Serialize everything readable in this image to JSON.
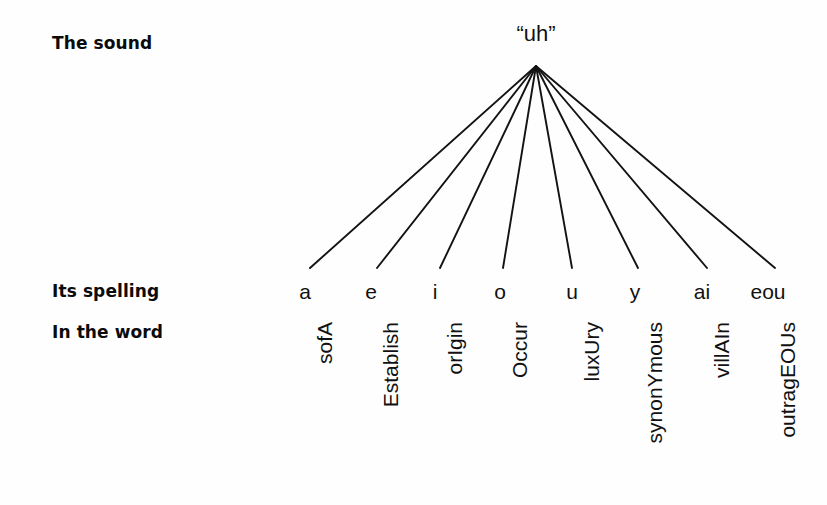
{
  "figure": {
    "background_color": "#fefefe",
    "ink_color": "#111111"
  },
  "rows": {
    "sound_label": "The sound",
    "spelling_label": "Its spelling",
    "word_label": "In the word"
  },
  "sound": {
    "node_text": "“uh”"
  },
  "chart_data": {
    "type": "diagram",
    "root": "“uh”",
    "row_labels": [
      "The sound",
      "Its spelling",
      "In the word"
    ],
    "branch_count": 8,
    "spellings": [
      "a",
      "e",
      "i",
      "o",
      "u",
      "y",
      "ai",
      "eou"
    ],
    "words": [
      "sofA",
      "Establish",
      "orIgin",
      "Occur",
      "luxUry",
      "synonYmous",
      "villAIn",
      "outragEOUs"
    ],
    "apex": {
      "x": 536,
      "y": 66
    },
    "branch_end_y": 268,
    "branch_end_x": [
      310,
      377,
      440,
      503,
      572,
      638,
      707,
      775
    ]
  },
  "branches": [
    {
      "spelling": "a",
      "word": "sofA",
      "x": 305,
      "line_end_x": 310
    },
    {
      "spelling": "e",
      "word": "Establish",
      "x": 371,
      "line_end_x": 377
    },
    {
      "spelling": "i",
      "word": "orIgin",
      "x": 435,
      "line_end_x": 440
    },
    {
      "spelling": "o",
      "word": "Occur",
      "x": 500,
      "line_end_x": 503
    },
    {
      "spelling": "u",
      "word": "luxUry",
      "x": 572,
      "line_end_x": 572
    },
    {
      "spelling": "y",
      "word": "synonYmous",
      "x": 635,
      "line_end_x": 638
    },
    {
      "spelling": "ai",
      "word": "villAIn",
      "x": 702,
      "line_end_x": 707
    },
    {
      "spelling": "eou",
      "word": "outragEOUs",
      "x": 768,
      "line_end_x": 775
    }
  ]
}
